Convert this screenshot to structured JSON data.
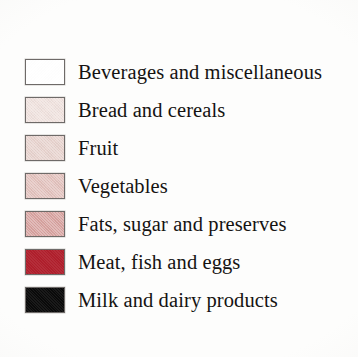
{
  "chart_data": {
    "type": "legend",
    "title": "",
    "subtitle": "",
    "xlabel": "",
    "ylabel": "",
    "legend_position": "standalone",
    "grid": false,
    "categories": [
      "Beverages and miscellaneous",
      "Bread and cereals",
      "Fruit",
      "Vegetables",
      "Fats, sugar and preserves",
      "Meat, fish and eggs",
      "Milk and dairy products"
    ],
    "colors": [
      "#ffffff",
      "#f0e2de",
      "#e8d3ce",
      "#e3c2bd",
      "#d8a3a0",
      "#b01f2c",
      "#0a0a0a"
    ],
    "series": [
      {
        "name": "Food group legend",
        "entries": [
          {
            "label": "Beverages and miscellaneous",
            "color": "#ffffff"
          },
          {
            "label": "Bread and cereals",
            "color": "#f0e2de"
          },
          {
            "label": "Fruit",
            "color": "#e8d3ce"
          },
          {
            "label": "Vegetables",
            "color": "#e3c2bd"
          },
          {
            "label": "Fats, sugar and preserves",
            "color": "#d8a3a0"
          },
          {
            "label": "Meat, fish and eggs",
            "color": "#b01f2c"
          },
          {
            "label": "Milk and dairy products",
            "color": "#0a0a0a"
          }
        ]
      }
    ]
  },
  "legend": {
    "items": [
      {
        "label": "Beverages and miscellaneous",
        "color": "#ffffff",
        "swatch_name": "swatch-beverages-and-miscellaneous"
      },
      {
        "label": "Bread and cereals",
        "color": "#f0e2de",
        "swatch_name": "swatch-bread-and-cereals"
      },
      {
        "label": "Fruit",
        "color": "#e8d3ce",
        "swatch_name": "swatch-fruit"
      },
      {
        "label": "Vegetables",
        "color": "#e3c2bd",
        "swatch_name": "swatch-vegetables"
      },
      {
        "label": "Fats, sugar and preserves",
        "color": "#d8a3a0",
        "swatch_name": "swatch-fats-sugar-and-preserves"
      },
      {
        "label": "Meat, fish and eggs",
        "color": "#b01f2c",
        "swatch_name": "swatch-meat-fish-and-eggs"
      },
      {
        "label": "Milk and dairy products",
        "color": "#0a0a0a",
        "swatch_name": "swatch-milk-and-dairy-products"
      }
    ]
  },
  "style": {
    "background": "#fdfdfc",
    "text_color": "#151312",
    "swatch_border": "#6e6a68"
  }
}
